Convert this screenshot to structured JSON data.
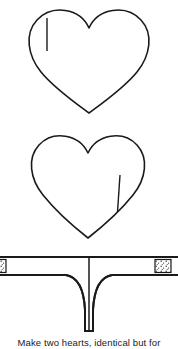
{
  "figure": {
    "background_color": "#ffffff",
    "line_color": "#1a1a1a",
    "caption": "Make two hearts, identical but for",
    "caption_truncated": true
  },
  "pieces": [
    {
      "id": "heart-top",
      "name": "heart-piece-upper",
      "shape": "heart",
      "mark": {
        "name": "slit-mark-left",
        "type": "line",
        "side": "left",
        "x": 47,
        "y_start": 18,
        "y_end": 51
      },
      "bounds": {
        "x": 28,
        "y": 10,
        "width": 122,
        "height": 103
      }
    },
    {
      "id": "heart-bottom",
      "name": "heart-piece-lower",
      "shape": "heart",
      "mark": {
        "name": "slit-mark-right",
        "type": "line",
        "side": "right",
        "x": 119,
        "y_start": 175,
        "y_end": 212
      },
      "bounds": {
        "x": 30,
        "y": 135,
        "width": 115,
        "height": 103
      }
    },
    {
      "id": "gusset",
      "name": "gusset-piece",
      "shape": "t-shaped-band",
      "bounds": {
        "x": 0,
        "y": 256,
        "width": 178,
        "height": 77
      },
      "details": [
        {
          "name": "hatched-tab-left",
          "type": "hatched-box"
        },
        {
          "name": "hatched-tab-right",
          "type": "hatched-box"
        },
        {
          "name": "center-fold-line",
          "type": "vertical-line"
        }
      ]
    }
  ]
}
